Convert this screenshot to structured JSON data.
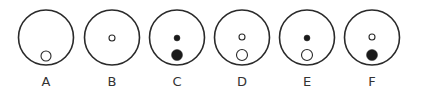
{
  "figure": {
    "stroke_color": "#2a2a2a",
    "fill_color": "#1a1a1a",
    "panels": [
      {
        "label": "A",
        "cx": 46,
        "dots": [
          {
            "cy": 56,
            "r": 5,
            "filled": false
          }
        ]
      },
      {
        "label": "B",
        "cx": 112,
        "dots": [
          {
            "cy": 38,
            "r": 3,
            "filled": false
          }
        ]
      },
      {
        "label": "C",
        "cx": 177,
        "dots": [
          {
            "cy": 38,
            "r": 3,
            "filled": true
          },
          {
            "cy": 55,
            "r": 5.5,
            "filled": true
          }
        ]
      },
      {
        "label": "D",
        "cx": 242,
        "dots": [
          {
            "cy": 37,
            "r": 3,
            "filled": false
          },
          {
            "cy": 55,
            "r": 5.5,
            "filled": false
          }
        ]
      },
      {
        "label": "E",
        "cx": 307,
        "dots": [
          {
            "cy": 38,
            "r": 3,
            "filled": true
          },
          {
            "cy": 55,
            "r": 5.5,
            "filled": false
          }
        ]
      },
      {
        "label": "F",
        "cx": 372,
        "dots": [
          {
            "cy": 37,
            "r": 3,
            "filled": false
          },
          {
            "cy": 55,
            "r": 5.5,
            "filled": true
          }
        ]
      }
    ]
  }
}
